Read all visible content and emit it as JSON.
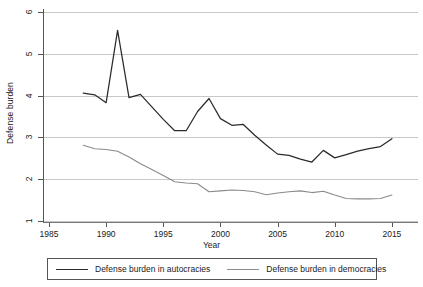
{
  "chart_data": {
    "type": "line",
    "title": "",
    "xlabel": "Year",
    "ylabel": "Defense burden",
    "xlim": [
      1985,
      2015.6
    ],
    "ylim": [
      1,
      6
    ],
    "grid": true,
    "legend_position": "bottom",
    "x_ticks": [
      "1985",
      "1990",
      "1995",
      "2000",
      "2005",
      "2010",
      "2015"
    ],
    "x_tick_values": [
      1985,
      1990,
      1995,
      2000,
      2005,
      2010,
      2015
    ],
    "y_ticks": [
      "1",
      "2",
      "3",
      "4",
      "5",
      "6"
    ],
    "y_tick_values": [
      1,
      2,
      3,
      4,
      5,
      6
    ],
    "x": [
      1988,
      1989,
      1990,
      1991,
      1992,
      1993,
      1994,
      1995,
      1996,
      1997,
      1998,
      1999,
      2000,
      2001,
      2002,
      2003,
      2004,
      2005,
      2006,
      2007,
      2008,
      2009,
      2010,
      2011,
      2012,
      2013,
      2014,
      2015
    ],
    "series": [
      {
        "name": "Defense burden in autocracies",
        "color": "#2b2b2b",
        "values": [
          4.06,
          4.02,
          3.83,
          5.56,
          3.95,
          4.03,
          3.73,
          3.43,
          3.16,
          3.16,
          3.62,
          3.93,
          3.45,
          3.29,
          3.31,
          3.05,
          2.82,
          2.6,
          2.57,
          2.48,
          2.41,
          2.69,
          2.51,
          2.59,
          2.67,
          2.73,
          2.78,
          2.97
        ]
      },
      {
        "name": "Defense burden in democracies",
        "color": "#8a8a8a",
        "values": [
          2.81,
          2.73,
          2.71,
          2.67,
          2.53,
          2.37,
          2.23,
          2.09,
          1.94,
          1.91,
          1.89,
          1.7,
          1.72,
          1.74,
          1.73,
          1.7,
          1.63,
          1.67,
          1.7,
          1.72,
          1.68,
          1.71,
          1.62,
          1.54,
          1.53,
          1.53,
          1.54,
          1.62
        ]
      }
    ]
  },
  "legend": {
    "entries": [
      {
        "label": "Defense burden in autocracies",
        "color": "#2b2b2b"
      },
      {
        "label": "Defense burden in democracies",
        "color": "#8a8a8a"
      }
    ]
  },
  "axes": {
    "y_title": "Defense burden",
    "x_title": "Year"
  }
}
